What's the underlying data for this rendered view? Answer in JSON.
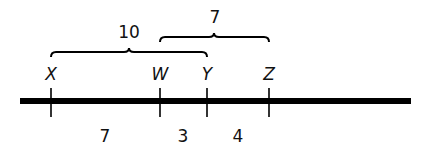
{
  "points": [
    {
      "label": "X",
      "x": 51
    },
    {
      "label": "W",
      "x": 160
    },
    {
      "label": "Y",
      "x": 207
    },
    {
      "label": "Z",
      "x": 269
    }
  ],
  "segments_below": [
    {
      "label": "7",
      "x": 105
    },
    {
      "label": "3",
      "x": 183
    },
    {
      "label": "4",
      "x": 238
    }
  ],
  "braces": [
    {
      "label": "10",
      "from": "X",
      "to": "Y"
    },
    {
      "label": "7",
      "from": "W",
      "to": "Z"
    }
  ],
  "colors": {
    "line": "#000000",
    "text": "#111111",
    "background": "#ffffff"
  }
}
